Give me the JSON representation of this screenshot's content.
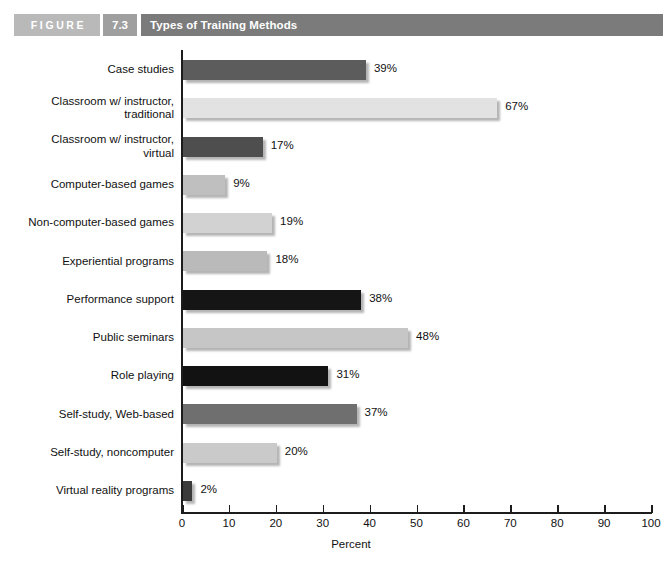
{
  "header": {
    "figure_word": "FIGURE",
    "figure_number": "7.3",
    "title": "Types of Training Methods"
  },
  "chart_data": {
    "type": "bar",
    "orientation": "horizontal",
    "title": "Types of Training Methods",
    "xlabel": "Percent",
    "ylabel": "",
    "xlim": [
      0,
      100
    ],
    "xticks": [
      0,
      10,
      20,
      30,
      40,
      50,
      60,
      70,
      80,
      90,
      100
    ],
    "grid": false,
    "legend": null,
    "categories": [
      "Case studies",
      "Classroom w/ instructor,\ntraditional",
      "Classroom w/ instructor,\nvirtual",
      "Computer-based games",
      "Non-computer-based games",
      "Experiential programs",
      "Performance support",
      "Public seminars",
      "Role playing",
      "Self-study, Web-based",
      "Self-study, noncomputer",
      "Virtual reality programs"
    ],
    "values": [
      39,
      67,
      17,
      9,
      19,
      18,
      38,
      48,
      31,
      37,
      20,
      2
    ],
    "data_labels": [
      "39%",
      "67%",
      "17%",
      "9%",
      "19%",
      "18%",
      "38%",
      "48%",
      "31%",
      "37%",
      "20%",
      "2%"
    ],
    "bar_colors": [
      "#5c5c5c",
      "#e2e2e2",
      "#4e4e4e",
      "#bfbfbf",
      "#d2d2d2",
      "#bababa",
      "#151515",
      "#c6c6c6",
      "#121212",
      "#6f6f6f",
      "#cacaca",
      "#3b3b3b"
    ]
  },
  "colors": {
    "figure_word_bg": "#b9b9b9",
    "figure_number_bg": "#9f9f9f",
    "title_bar_bg": "#7b7b7b",
    "axis": "#1c1c1c",
    "page_bg": "#ffffff"
  }
}
